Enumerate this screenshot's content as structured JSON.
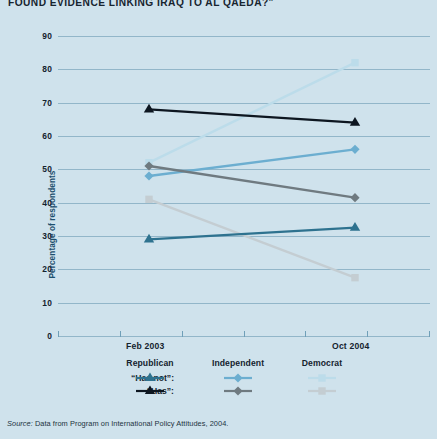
{
  "title": "Found Evidence Linking Iraq to Al Qaeda?\"",
  "yaxis_label": "Percentage of respondents",
  "source": {
    "label": "Source:",
    "text": " Data from Program on International Policy Attitudes, 2004."
  },
  "legend": {
    "parties": [
      "Republican",
      "Independent",
      "Democrat"
    ],
    "rows": [
      {
        "label": "“Has not”:",
        "colors": [
          "#2e728f",
          "#6caed0",
          "#bcdcea"
        ]
      },
      {
        "label": "“Has”:",
        "colors": [
          "#0d1620",
          "#6f7a80",
          "#c4cdd2"
        ]
      }
    ]
  },
  "chart_data": {
    "type": "line",
    "title": "Found Evidence Linking Iraq to Al Qaeda?\"",
    "xlabel": "",
    "ylabel": "Percentage of respondents",
    "x": [
      "Feb 2003",
      "Oct 2004"
    ],
    "xtick_labels": [
      "Feb 2003",
      "Oct 2004"
    ],
    "ylim": [
      0,
      90
    ],
    "yticks": [
      0,
      10,
      20,
      30,
      40,
      50,
      60,
      70,
      80,
      90
    ],
    "ytick_labels": [
      "0",
      "10",
      "20",
      "30",
      "40",
      "50",
      "60",
      "70",
      "80",
      "90"
    ],
    "grid": true,
    "legend_position": "below",
    "series": [
      {
        "name": "Republican “Has”",
        "party": "Republican",
        "answer": "Has",
        "color": "#0d1620",
        "marker": "triangle",
        "values": [
          68,
          64
        ]
      },
      {
        "name": "Republican “Has not”",
        "party": "Republican",
        "answer": "Has not",
        "color": "#2e728f",
        "marker": "triangle",
        "values": [
          29,
          32.5
        ]
      },
      {
        "name": "Independent “Has”",
        "party": "Independent",
        "answer": "Has",
        "color": "#6f7a80",
        "marker": "diamond",
        "values": [
          51,
          41.5
        ]
      },
      {
        "name": "Independent “Has not”",
        "party": "Independent",
        "answer": "Has not",
        "color": "#6caed0",
        "marker": "diamond",
        "values": [
          48,
          56
        ]
      },
      {
        "name": "Democrat “Has”",
        "party": "Democrat",
        "answer": "Has",
        "color": "#c4cdd2",
        "marker": "square",
        "values": [
          41,
          17.5
        ]
      },
      {
        "name": "Democrat “Has not”",
        "party": "Democrat",
        "answer": "Has not",
        "color": "#bcdcea",
        "marker": "square",
        "values": [
          52,
          82
        ]
      }
    ]
  },
  "colors": {
    "background": "#cfe2ec",
    "gridline": "#7ea7bd",
    "text": "#14222e",
    "yaxis_title": "#1d4f6e"
  }
}
